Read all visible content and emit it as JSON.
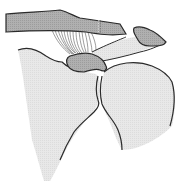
{
  "diagram": {
    "structures": [
      {
        "id": "clavicle",
        "label": ""
      },
      {
        "id": "acromion",
        "label": ""
      },
      {
        "id": "coracoid-process",
        "label": ""
      },
      {
        "id": "coracoclavicular-ligaments",
        "label": ""
      },
      {
        "id": "coracoacromial-ligament",
        "label": ""
      },
      {
        "id": "scapula",
        "label": ""
      },
      {
        "id": "humeral-head",
        "label": ""
      },
      {
        "id": "cut-line",
        "label": ""
      }
    ],
    "colors": {
      "bone_dark": "#a8a8a8",
      "bone_light": "#e6e6e6",
      "outline": "#2a2a2a",
      "background": "#ffffff"
    }
  }
}
